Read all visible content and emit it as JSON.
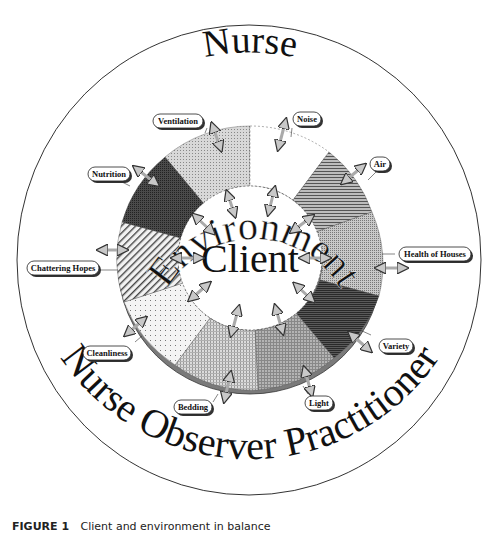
{
  "diagram": {
    "outer_label_top": "Nurse",
    "outer_label_bottom": "Nurse Observer Practitioner",
    "ring_label": "Environment",
    "center_label": "Client",
    "segments": [
      {
        "name": "Ventilation",
        "pattern": "fine-dots-light",
        "color": "#bdbdbd"
      },
      {
        "name": "Noise",
        "pattern": "blank-dashed",
        "color": "#ffffff"
      },
      {
        "name": "Air",
        "pattern": "horizontal-lines",
        "color": "#8c8c8c"
      },
      {
        "name": "Health of Houses",
        "pattern": "crosshatch-medium",
        "color": "#a8a8a8"
      },
      {
        "name": "Variety",
        "pattern": "horizontal-dense",
        "color": "#4a4a4a"
      },
      {
        "name": "Light",
        "pattern": "grid-medium",
        "color": "#9a9a9a"
      },
      {
        "name": "Bedding",
        "pattern": "grid-light",
        "color": "#c4c4c4"
      },
      {
        "name": "Cleanliness",
        "pattern": "sparse-dots",
        "color": "#e6e6e6"
      },
      {
        "name": "Chattering Hopes",
        "pattern": "diagonal-lines",
        "color": "#d0d0d0"
      },
      {
        "name": "Nutrition",
        "pattern": "dark-crosshatch",
        "color": "#3c3c3c"
      }
    ],
    "labels": {
      "ventilation": "Ventilation",
      "noise": "Noise",
      "air": "Air",
      "health_of_houses": "Health of Houses",
      "variety": "Variety",
      "light": "Light",
      "bedding": "Bedding",
      "cleanliness": "Cleanliness",
      "chattering_hopes": "Chattering Hopes",
      "nutrition": "Nutrition"
    },
    "icons": {
      "arrow": "double-headed-arrow-icon"
    }
  },
  "caption": {
    "figure_number": "FIGURE 1",
    "text": "Client and environment in balance"
  }
}
